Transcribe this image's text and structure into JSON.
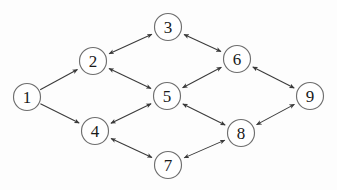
{
  "diagram": {
    "background_color": "#fdfdfd",
    "node_fill_color": "#ffffff",
    "node_stroke_color": "#6e6e6e",
    "edge_color": "#3a3a3a",
    "label_color": "#1a1a1a",
    "node_radius": 13.5,
    "nodes": [
      {
        "id": "1",
        "label": "1",
        "cx": 27,
        "cy": 97,
        "r": 13.5
      },
      {
        "id": "2",
        "label": "2",
        "cx": 93,
        "cy": 61,
        "r": 13.5
      },
      {
        "id": "3",
        "label": "3",
        "cx": 168,
        "cy": 27,
        "r": 13.5
      },
      {
        "id": "4",
        "label": "4",
        "cx": 95,
        "cy": 131,
        "r": 13.5
      },
      {
        "id": "5",
        "label": "5",
        "cx": 167,
        "cy": 96,
        "r": 13.5
      },
      {
        "id": "6",
        "label": "6",
        "cx": 237,
        "cy": 59,
        "r": 13.5
      },
      {
        "id": "7",
        "label": "7",
        "cx": 168,
        "cy": 165,
        "r": 13.5
      },
      {
        "id": "8",
        "label": "8",
        "cx": 241,
        "cy": 133,
        "r": 13.5
      },
      {
        "id": "9",
        "label": "9",
        "cx": 310,
        "cy": 96,
        "r": 13.5
      }
    ],
    "edges": [
      {
        "id": "e-1-2",
        "from": "1",
        "to": "2",
        "direction": "forward"
      },
      {
        "id": "e-1-4",
        "from": "1",
        "to": "4",
        "direction": "forward"
      },
      {
        "id": "e-2-3",
        "from": "2",
        "to": "3",
        "direction": "both"
      },
      {
        "id": "e-2-5",
        "from": "2",
        "to": "5",
        "direction": "both"
      },
      {
        "id": "e-3-6",
        "from": "3",
        "to": "6",
        "direction": "both"
      },
      {
        "id": "e-4-5",
        "from": "4",
        "to": "5",
        "direction": "both"
      },
      {
        "id": "e-4-7",
        "from": "4",
        "to": "7",
        "direction": "both"
      },
      {
        "id": "e-5-6",
        "from": "5",
        "to": "6",
        "direction": "both"
      },
      {
        "id": "e-5-8",
        "from": "5",
        "to": "8",
        "direction": "both"
      },
      {
        "id": "e-6-9",
        "from": "6",
        "to": "9",
        "direction": "both"
      },
      {
        "id": "e-7-8",
        "from": "7",
        "to": "8",
        "direction": "both"
      },
      {
        "id": "e-8-9",
        "from": "8",
        "to": "9",
        "direction": "both"
      }
    ]
  }
}
